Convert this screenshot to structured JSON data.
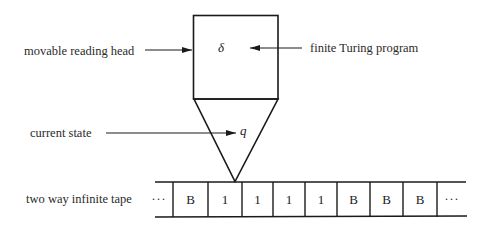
{
  "labels": {
    "reading_head": "movable reading head",
    "program": "finite Turing program",
    "state": "current state",
    "tape": "two way infinite tape"
  },
  "head": {
    "program_symbol": "δ",
    "state_symbol": "q"
  },
  "tape": {
    "left_ellipsis": "···",
    "cells": [
      "B",
      "1",
      "1",
      "1",
      "1",
      "B",
      "B",
      "B"
    ],
    "right_ellipsis": "···",
    "head_position_index": 1
  },
  "colors": {
    "stroke": "#1a1a1a",
    "background": "#ffffff"
  }
}
